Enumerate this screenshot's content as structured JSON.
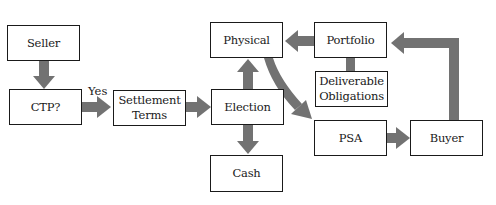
{
  "diagram": {
    "arrow_color": "#727272",
    "nodes": {
      "seller": {
        "label": "Seller"
      },
      "ctp": {
        "label": "CTP?"
      },
      "settlement_terms": {
        "label": "Settlement\nTerms"
      },
      "physical": {
        "label": "Physical"
      },
      "election": {
        "label": "Election"
      },
      "cash": {
        "label": "Cash"
      },
      "portfolio": {
        "label": "Portfolio"
      },
      "deliverable_obligations": {
        "label": "Deliverable\nObligations"
      },
      "psa": {
        "label": "PSA"
      },
      "buyer": {
        "label": "Buyer"
      }
    },
    "edge_labels": {
      "ctp_to_settlement": "Yes"
    },
    "edges": [
      {
        "from": "Seller",
        "to": "CTP?"
      },
      {
        "from": "CTP?",
        "to": "Settlement Terms",
        "label": "Yes"
      },
      {
        "from": "Settlement Terms",
        "to": "Election"
      },
      {
        "from": "Election",
        "to": "Physical"
      },
      {
        "from": "Election",
        "to": "Cash"
      },
      {
        "from": "Physical",
        "to": "PSA"
      },
      {
        "from": "PSA",
        "to": "Buyer"
      },
      {
        "from": "Buyer",
        "to": "Portfolio"
      },
      {
        "from": "Portfolio",
        "to": "Physical"
      },
      {
        "from": "Portfolio",
        "to": "Deliverable Obligations",
        "connector": true
      }
    ]
  }
}
